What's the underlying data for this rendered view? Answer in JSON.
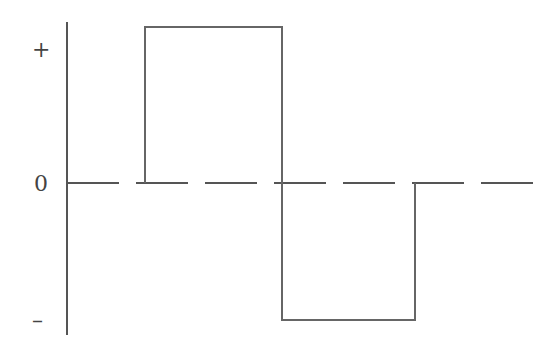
{
  "diagram": {
    "type": "waveform",
    "labels": {
      "positive": "+",
      "zero": "0",
      "negative": "–"
    },
    "colors": {
      "line": "#555555",
      "background": "#ffffff"
    },
    "waveform_points": [
      {
        "x": 145,
        "level": "0"
      },
      {
        "x": 145,
        "level": "+"
      },
      {
        "x": 282,
        "level": "+"
      },
      {
        "x": 282,
        "level": "-"
      },
      {
        "x": 415,
        "level": "-"
      },
      {
        "x": 415,
        "level": "0"
      }
    ]
  }
}
